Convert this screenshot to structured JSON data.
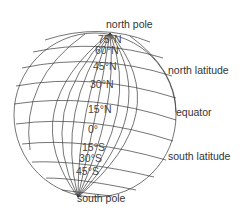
{
  "diagram": {
    "type": "globe-latitude",
    "colors": {
      "line": "#3a3a3a",
      "text": "#333333",
      "background": "#ffffff"
    },
    "labels": {
      "north_pole": "north pole",
      "south_pole": "south pole",
      "north_latitude": "north latitude",
      "equator": "equator",
      "south_latitude": "south latitude"
    },
    "latitudes": [
      {
        "id": "75n",
        "label": "75°N"
      },
      {
        "id": "60n",
        "label": "60°N"
      },
      {
        "id": "45n",
        "label": "45°N"
      },
      {
        "id": "30n",
        "label": "30°N"
      },
      {
        "id": "15n",
        "label": "15°N"
      },
      {
        "id": "0",
        "label": "0°"
      },
      {
        "id": "15s",
        "label": "15°S"
      },
      {
        "id": "30s",
        "label": "30°S"
      },
      {
        "id": "45s",
        "label": "45°S"
      }
    ]
  }
}
